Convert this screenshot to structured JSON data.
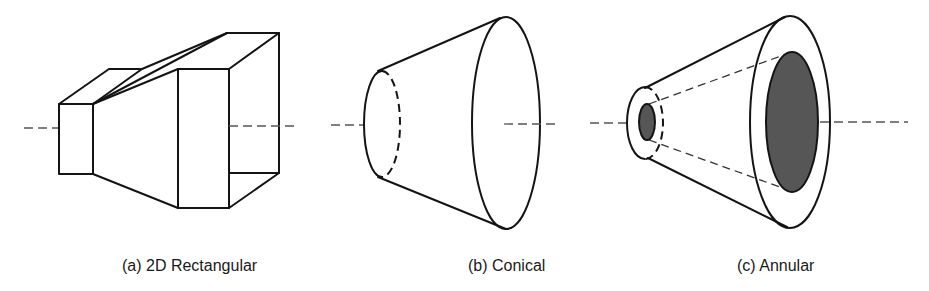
{
  "figure": {
    "panels": [
      {
        "id": "a",
        "caption": "(a) 2D Rectangular",
        "shape": "rectangular-horn"
      },
      {
        "id": "b",
        "caption": "(b) Conical",
        "shape": "conical-horn"
      },
      {
        "id": "c",
        "caption": "(c) Annular",
        "shape": "annular-horn"
      }
    ],
    "colors": {
      "line": "#141414",
      "axis": "#555555",
      "aperture_fill": "#565656",
      "background": "#ffffff"
    }
  }
}
